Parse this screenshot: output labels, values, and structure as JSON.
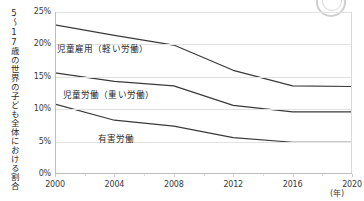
{
  "chart_data": {
    "type": "line",
    "title": "",
    "xlabel": "(年)",
    "ylabel": "5〜17歳の世界の子ども全体における割合",
    "x": [
      2000,
      2004,
      2008,
      2012,
      2016,
      2020
    ],
    "xlim": [
      2000,
      2020
    ],
    "ylim": [
      0,
      25
    ],
    "ytick_labels": [
      "0%",
      "5%",
      "10%",
      "15%",
      "20%",
      "25%"
    ],
    "ytick_values": [
      0,
      5,
      10,
      15,
      20,
      25
    ],
    "xtick_labels": [
      "2000",
      "2004",
      "2008",
      "2012",
      "2016",
      "2020"
    ],
    "grid": true,
    "legend": "inline-labels",
    "series": [
      {
        "name": "児童雇用（軽い労働）",
        "values": [
          23.0,
          21.4,
          19.9,
          16.0,
          13.6,
          13.5
        ],
        "color": "#3a3a3a"
      },
      {
        "name": "児童労働（重い労働）",
        "values": [
          15.6,
          14.3,
          13.6,
          10.6,
          9.6,
          9.6
        ],
        "color": "#3a3a3a"
      },
      {
        "name": "有害労働",
        "values": [
          10.8,
          8.3,
          7.4,
          5.6,
          4.9,
          4.9
        ],
        "color": "#3a3a3a"
      }
    ]
  },
  "axis": {
    "y_title": "5〜17歳の世界の子ども全体における割合",
    "x_unit": "(年)"
  }
}
